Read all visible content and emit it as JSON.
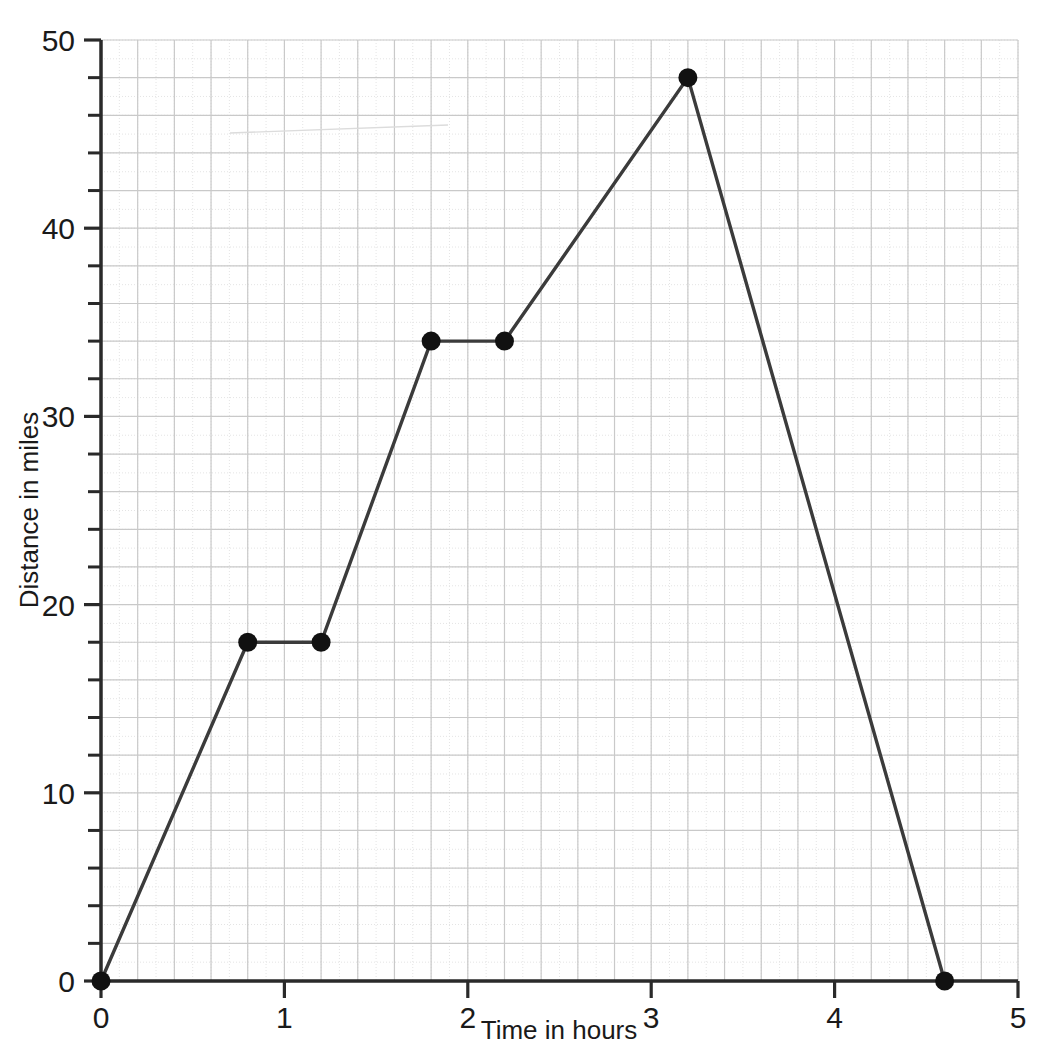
{
  "chart_data": {
    "type": "line",
    "title": "",
    "xlabel": "Time in hours",
    "ylabel": "Distance in miles",
    "xlim": [
      0,
      5
    ],
    "ylim": [
      0,
      50
    ],
    "x_major_ticks": [
      0,
      1,
      2,
      3,
      4,
      5
    ],
    "x_tick_labels": [
      "0",
      "1",
      "2",
      "3",
      "4",
      "5"
    ],
    "y_major_ticks": [
      0,
      10,
      20,
      30,
      40,
      50
    ],
    "y_tick_labels": [
      "0",
      "10",
      "20",
      "30",
      "40",
      "50"
    ],
    "x_minor_step": 0.2,
    "y_minor_step": 2,
    "grid": true,
    "legend": "none",
    "series": [
      {
        "name": "Journey",
        "x": [
          0,
          0.8,
          1.2,
          1.8,
          2.2,
          3.2,
          4.6
        ],
        "y": [
          0,
          18,
          18,
          34,
          34,
          48,
          0
        ],
        "marker": "circle",
        "line_color": "#3b3b3b",
        "marker_color": "#111111"
      }
    ],
    "points": [
      {
        "x": 0,
        "y": 0
      },
      {
        "x": 0.8,
        "y": 18
      },
      {
        "x": 1.2,
        "y": 18
      },
      {
        "x": 1.8,
        "y": 34
      },
      {
        "x": 2.2,
        "y": 34
      },
      {
        "x": 3.2,
        "y": 48
      },
      {
        "x": 4.6,
        "y": 0
      }
    ]
  },
  "colors": {
    "background": "#ffffff",
    "axis": "#2a2a2a",
    "grid_major": "#c9c9c9",
    "grid_minor": "#e4e4e4",
    "data_line": "#3b3b3b",
    "marker": "#111111",
    "text": "#1a1a1a"
  },
  "axes": {
    "x_title": "Time in hours",
    "y_title": "Distance in miles"
  }
}
